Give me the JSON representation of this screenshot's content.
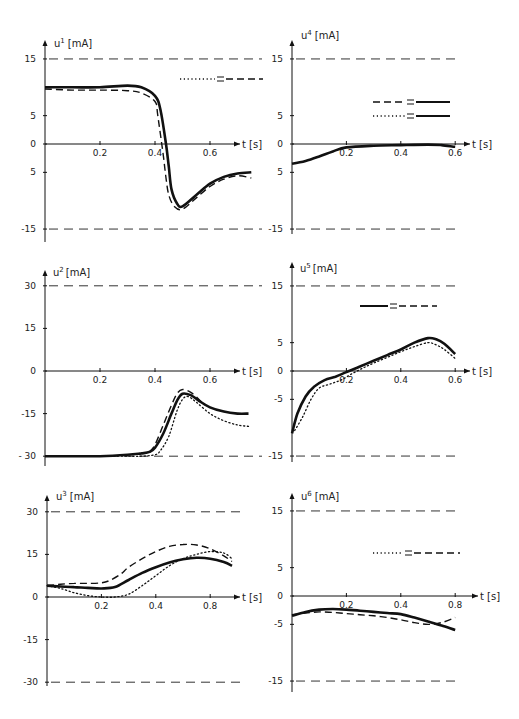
{
  "figure": {
    "width": 519,
    "height": 719,
    "line_color": "#111111",
    "limit_color": "#333333"
  },
  "legend_styles": {
    "solid": "solid",
    "dashed": "dashed",
    "dotted": "dotted"
  },
  "chart_data": [
    {
      "id": "u1",
      "type": "line",
      "title": "",
      "ylabel": "u1 [mA]",
      "ylabel_base": "u",
      "ylabel_sup": "1",
      "ylabel_unit": "[mA]",
      "xlabel": "t [s]",
      "ylim": [
        -17,
        18
      ],
      "xlim": [
        0,
        0.72
      ],
      "yticks": [
        15,
        5,
        0,
        -5,
        -15
      ],
      "ytick_labels": [
        "15",
        "5",
        "0",
        "5",
        "-15"
      ],
      "xticks": [
        0.2,
        0.4,
        0.6
      ],
      "xtick_labels": [
        "0.2",
        "0.4",
        "0.6"
      ],
      "limit_lines": [
        15,
        -15
      ],
      "legend": [
        {
          "left": "dotted",
          "right": "dashed",
          "symbol": "="
        }
      ],
      "series": [
        {
          "name": "solid",
          "style": "solid",
          "x": [
            0,
            0.1,
            0.2,
            0.3,
            0.35,
            0.4,
            0.42,
            0.44,
            0.45,
            0.46,
            0.48,
            0.5,
            0.55,
            0.6,
            0.65,
            0.7,
            0.75
          ],
          "y": [
            10,
            10,
            10,
            10.3,
            10,
            8.5,
            6,
            0,
            -4,
            -8,
            -10.5,
            -11,
            -9,
            -7,
            -5.8,
            -5.2,
            -5
          ]
        },
        {
          "name": "dashed",
          "style": "dashed",
          "x": [
            0,
            0.1,
            0.2,
            0.3,
            0.35,
            0.4,
            0.41,
            0.43,
            0.44,
            0.45,
            0.47,
            0.5,
            0.55,
            0.6,
            0.65,
            0.7,
            0.75
          ],
          "y": [
            9.7,
            9.5,
            9.5,
            9.4,
            9,
            7.5,
            5,
            -2,
            -6,
            -9,
            -11,
            -11.5,
            -9.5,
            -7.5,
            -6.2,
            -5.6,
            -6
          ]
        }
      ]
    },
    {
      "id": "u4",
      "type": "line",
      "title": "",
      "ylabel": "u4 [mA]",
      "ylabel_base": "u",
      "ylabel_sup": "4",
      "ylabel_unit": "[mA]",
      "xlabel": "t [s]",
      "ylim": [
        -17,
        18
      ],
      "xlim": [
        0,
        0.66
      ],
      "yticks": [
        15,
        5,
        0,
        -5,
        -15
      ],
      "ytick_labels": [
        "15",
        "5",
        "0",
        "5",
        "-15"
      ],
      "xticks": [
        0.2,
        0.4,
        0.6
      ],
      "xtick_labels": [
        "0.2",
        "0.4",
        "0.6"
      ],
      "limit_lines": [
        15,
        -15
      ],
      "legend": [
        {
          "left": "dashed",
          "right": "solid",
          "symbol": "="
        },
        {
          "left": "dotted",
          "right": "solid",
          "symbol": "="
        }
      ],
      "series": [
        {
          "name": "solid",
          "style": "solid",
          "x": [
            0,
            0.05,
            0.1,
            0.15,
            0.2,
            0.3,
            0.4,
            0.5,
            0.55,
            0.6
          ],
          "y": [
            -3.5,
            -3,
            -2.2,
            -1.3,
            -0.6,
            -0.3,
            -0.2,
            -0.1,
            -0.2,
            -0.5
          ]
        }
      ]
    },
    {
      "id": "u2",
      "type": "line",
      "title": "",
      "ylabel": "u2 [mA]",
      "ylabel_base": "u",
      "ylabel_sup": "2",
      "ylabel_unit": "[mA]",
      "xlabel": "t [s]",
      "ylim": [
        -32,
        34
      ],
      "xlim": [
        0,
        0.72
      ],
      "yticks": [
        30,
        15,
        0,
        -15,
        -30
      ],
      "ytick_labels": [
        "30",
        "15",
        "0",
        "-15",
        "- 30"
      ],
      "xticks": [
        0.2,
        0.4,
        0.6
      ],
      "xtick_labels": [
        "0.2",
        "0.4",
        "0.6"
      ],
      "limit_lines": [
        30,
        -30
      ],
      "legend": [],
      "series": [
        {
          "name": "solid",
          "style": "solid",
          "x": [
            0,
            0.1,
            0.2,
            0.3,
            0.35,
            0.38,
            0.4,
            0.43,
            0.46,
            0.48,
            0.5,
            0.53,
            0.56,
            0.6,
            0.65,
            0.7,
            0.74
          ],
          "y": [
            -30,
            -30,
            -30,
            -29.5,
            -29,
            -28.5,
            -27,
            -22,
            -15,
            -10.5,
            -8,
            -8.5,
            -10.5,
            -12.8,
            -14.3,
            -15,
            -15
          ]
        },
        {
          "name": "dashed",
          "style": "dashed",
          "x": [
            0.38,
            0.4,
            0.43,
            0.46,
            0.48,
            0.5,
            0.53,
            0.56,
            0.58
          ],
          "y": [
            -28.5,
            -26,
            -19,
            -12,
            -8,
            -6.5,
            -7.5,
            -10,
            -12
          ]
        },
        {
          "name": "dotted",
          "style": "dotted",
          "x": [
            0.25,
            0.3,
            0.35,
            0.4,
            0.42,
            0.45,
            0.48,
            0.5,
            0.52,
            0.55,
            0.6,
            0.65,
            0.7,
            0.74
          ],
          "y": [
            -30,
            -30,
            -30,
            -29.5,
            -28,
            -23,
            -14,
            -10,
            -9,
            -11,
            -15,
            -17.5,
            -19,
            -19.5
          ]
        }
      ]
    },
    {
      "id": "u5",
      "type": "line",
      "title": "",
      "ylabel": "u5 [mA]",
      "ylabel_base": "u",
      "ylabel_sup": "5",
      "ylabel_unit": "[mA]",
      "xlabel": "t [s]",
      "ylim": [
        -17,
        18
      ],
      "xlim": [
        0,
        0.66
      ],
      "yticks": [
        15,
        5,
        0,
        -5,
        -15
      ],
      "ytick_labels": [
        "15",
        "5",
        "0",
        "-5",
        "-15"
      ],
      "xticks": [
        0.2,
        0.4,
        0.6
      ],
      "xtick_labels": [
        "0.2",
        "0.4",
        "0.6"
      ],
      "limit_lines": [
        15,
        -15
      ],
      "legend": [
        {
          "left": "solid",
          "right": "dashed",
          "symbol": "="
        }
      ],
      "series": [
        {
          "name": "solid",
          "style": "solid",
          "x": [
            0,
            0.02,
            0.05,
            0.08,
            0.12,
            0.16,
            0.2,
            0.25,
            0.3,
            0.35,
            0.4,
            0.45,
            0.5,
            0.53,
            0.56,
            0.6
          ],
          "y": [
            -11,
            -7.5,
            -4.5,
            -2.8,
            -1.6,
            -1,
            -0.2,
            0.8,
            1.8,
            2.8,
            3.8,
            5,
            5.8,
            5.6,
            4.8,
            3
          ]
        },
        {
          "name": "dotted",
          "style": "dotted",
          "x": [
            0.01,
            0.04,
            0.07,
            0.1,
            0.14,
            0.18,
            0.22,
            0.26,
            0.3,
            0.35,
            0.4,
            0.45,
            0.5,
            0.53,
            0.56,
            0.6
          ],
          "y": [
            -10.5,
            -8,
            -5,
            -3,
            -2.3,
            -1.6,
            -0.5,
            0.5,
            1.4,
            2.4,
            3.4,
            4.3,
            5,
            4.6,
            3.8,
            2.2
          ]
        }
      ]
    },
    {
      "id": "u3",
      "type": "line",
      "title": "",
      "ylabel": "u3 [mA]",
      "ylabel_base": "u",
      "ylabel_sup": "3",
      "ylabel_unit": "[mA]",
      "xlabel": "t [s]",
      "ylim": [
        -32,
        34
      ],
      "xlim": [
        0,
        0.72
      ],
      "yticks": [
        30,
        15,
        0,
        -15,
        -30
      ],
      "ytick_labels": [
        "30",
        "15",
        "0",
        "-15",
        "-30"
      ],
      "xticks": [
        0.2,
        0.4,
        0.6
      ],
      "xtick_labels": [
        "0.2",
        "0.4",
        "0.8"
      ],
      "limit_lines": [
        30,
        -30
      ],
      "legend": [],
      "series": [
        {
          "name": "solid",
          "style": "solid",
          "x": [
            0,
            0.05,
            0.1,
            0.15,
            0.2,
            0.25,
            0.3,
            0.35,
            0.4,
            0.45,
            0.5,
            0.55,
            0.6,
            0.65,
            0.68
          ],
          "y": [
            4,
            3.7,
            3.5,
            3.2,
            3,
            3.5,
            6,
            8.5,
            10.5,
            12.2,
            13.3,
            13.8,
            13.5,
            12.3,
            11
          ]
        },
        {
          "name": "dashed",
          "style": "dashed",
          "x": [
            0,
            0.05,
            0.1,
            0.15,
            0.2,
            0.23,
            0.27,
            0.3,
            0.35,
            0.4,
            0.45,
            0.5,
            0.55,
            0.6,
            0.65,
            0.68
          ],
          "y": [
            4,
            4.5,
            4.8,
            4.8,
            5,
            5.8,
            8,
            10.5,
            13.5,
            16,
            17.8,
            18.5,
            18.3,
            17,
            14.5,
            12.5
          ]
        },
        {
          "name": "dotted",
          "style": "dotted",
          "x": [
            0,
            0.05,
            0.1,
            0.15,
            0.2,
            0.25,
            0.3,
            0.35,
            0.4,
            0.45,
            0.5,
            0.55,
            0.6,
            0.65,
            0.68
          ],
          "y": [
            4,
            3,
            1.5,
            0.5,
            0,
            0,
            1,
            4,
            7.5,
            11,
            13.5,
            15,
            16,
            15.5,
            13.5
          ]
        }
      ]
    },
    {
      "id": "u6",
      "type": "line",
      "title": "",
      "ylabel": "u6 [mA]",
      "ylabel_base": "u",
      "ylabel_sup": "6",
      "ylabel_unit": "[mA]",
      "xlabel": "t [s]",
      "ylim": [
        -17,
        18
      ],
      "xlim": [
        0,
        0.66
      ],
      "yticks": [
        15,
        5,
        0,
        -5,
        -15
      ],
      "ytick_labels": [
        "15",
        "5",
        "0",
        "-5",
        "-15"
      ],
      "xticks": [
        0.2,
        0.4,
        0.6
      ],
      "xtick_labels": [
        "0.2",
        "0.4",
        "0.8"
      ],
      "limit_lines": [
        15,
        -15
      ],
      "legend": [
        {
          "left": "dotted",
          "right": "dashed",
          "symbol": "="
        }
      ],
      "series": [
        {
          "name": "solid",
          "style": "solid",
          "x": [
            0,
            0.05,
            0.1,
            0.15,
            0.2,
            0.25,
            0.3,
            0.35,
            0.4,
            0.45,
            0.5,
            0.55,
            0.6
          ],
          "y": [
            -3.5,
            -2.8,
            -2.4,
            -2.3,
            -2.4,
            -2.6,
            -2.8,
            -3,
            -3.2,
            -3.8,
            -4.5,
            -5.2,
            -6
          ]
        },
        {
          "name": "dashed",
          "style": "dashed",
          "x": [
            0,
            0.05,
            0.1,
            0.15,
            0.2,
            0.25,
            0.3,
            0.35,
            0.4,
            0.45,
            0.5,
            0.55,
            0.6
          ],
          "y": [
            -3.3,
            -3,
            -2.8,
            -2.9,
            -3.1,
            -3.3,
            -3.5,
            -3.8,
            -4.2,
            -4.7,
            -5,
            -4.7,
            -3.8
          ]
        }
      ]
    }
  ],
  "panels_layout": [
    {
      "id": "u1",
      "ax_x": 45,
      "y_top": 40,
      "y_bottom": 242,
      "x_end": 240,
      "y0px": 144,
      "yscale": 5.67,
      "x0px": 45,
      "xscale": 275,
      "limit_x1": 262
    },
    {
      "id": "u4",
      "ax_x": 292,
      "y_top": 40,
      "y_bottom": 234,
      "x_end": 470,
      "y0px": 144,
      "yscale": 5.67,
      "x0px": 292,
      "xscale": 272,
      "limit_x1": 457
    },
    {
      "id": "u2",
      "ax_x": 45,
      "y_top": 270,
      "y_bottom": 466,
      "x_end": 240,
      "y0px": 371,
      "yscale": 2.84,
      "x0px": 45,
      "xscale": 275,
      "limit_x1": 262
    },
    {
      "id": "u5",
      "ax_x": 292,
      "y_top": 262,
      "y_bottom": 462,
      "x_end": 470,
      "y0px": 371,
      "yscale": 5.67,
      "x0px": 292,
      "xscale": 272,
      "limit_x1": 457
    },
    {
      "id": "u3",
      "ax_x": 47,
      "y_top": 495,
      "y_bottom": 686,
      "x_end": 240,
      "y0px": 597,
      "yscale": 2.84,
      "x0px": 47,
      "xscale": 272,
      "limit_x1": 240
    },
    {
      "id": "u6",
      "ax_x": 292,
      "y_top": 493,
      "y_bottom": 692,
      "x_end": 478,
      "y0px": 596,
      "yscale": 5.67,
      "x0px": 292,
      "xscale": 272,
      "limit_x1": 457
    }
  ],
  "legend_layout": [
    {
      "id": "u1",
      "rows": [
        {
          "x": 180,
          "y": 79,
          "w_left": 35,
          "w_right": 37
        }
      ]
    },
    {
      "id": "u4",
      "rows": [
        {
          "x": 373,
          "y": 102,
          "w_left": 32,
          "w_right": 34
        },
        {
          "x": 373,
          "y": 116,
          "w_left": 32,
          "w_right": 34
        }
      ]
    },
    {
      "id": "u5",
      "rows": [
        {
          "x": 360,
          "y": 306,
          "w_left": 28,
          "w_right": 38
        }
      ]
    },
    {
      "id": "u6",
      "rows": [
        {
          "x": 373,
          "y": 553,
          "w_left": 30,
          "w_right": 46
        }
      ]
    }
  ]
}
